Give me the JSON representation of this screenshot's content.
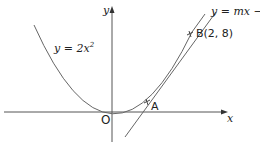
{
  "diagram": {
    "axes": {
      "x_label": "x",
      "y_label": "y",
      "origin_label": "O"
    },
    "curve": {
      "label_prefix": "y = 2",
      "label_var": "x",
      "label_exp": "2",
      "equation": "y = 2x^2"
    },
    "line": {
      "label": "y = mx − 2",
      "equation": "y = mx - 2"
    },
    "points": [
      {
        "name": "A",
        "label": "A"
      },
      {
        "name": "B",
        "label": "B(2, 8)",
        "x": 2,
        "y": 8
      }
    ],
    "colors": {
      "stroke": "#555555",
      "text": "#222222",
      "background": "#ffffff"
    }
  }
}
